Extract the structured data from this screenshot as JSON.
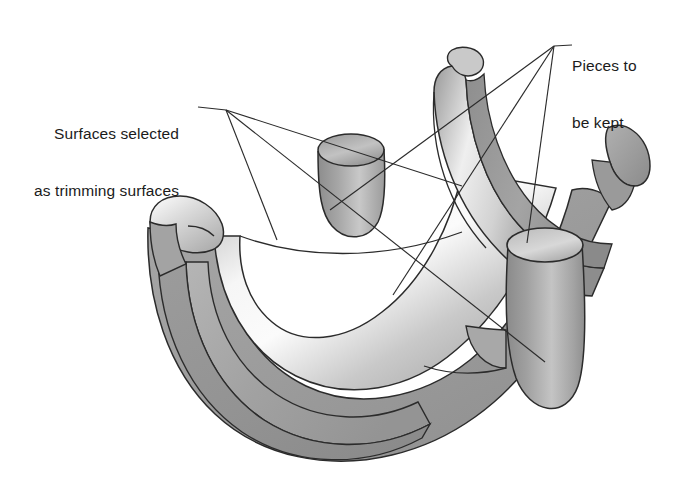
{
  "figure": {
    "background_color": "#ffffff",
    "width": 680,
    "height": 500
  },
  "callouts": {
    "left": {
      "name": "surfaces-selected-callout",
      "line1": "Surfaces selected",
      "line2": "as trimming surfaces",
      "leader_vertex": [
        226,
        110
      ],
      "leader_endpoints": [
        [
          277,
          240
        ],
        [
          462,
          186
        ],
        [
          545,
          362
        ]
      ]
    },
    "right": {
      "name": "pieces-to-be-kept-callout",
      "line1": "Pieces to",
      "line2": "be kept",
      "leader_vertex": [
        554,
        46
      ],
      "leader_endpoints": [
        [
          330,
          210
        ],
        [
          393,
          295
        ],
        [
          527,
          243
        ]
      ]
    }
  },
  "style": {
    "outline_color": "#2b2b2b",
    "leader_color": "#2b2b2b",
    "text_color": "#1b1b1b",
    "shade_light": "#f2f2f2",
    "shade_mid": "#b9b9b9",
    "shade_dark": "#8e8e8e",
    "shade_darker": "#7a7a7a"
  },
  "geometry": {
    "description": "Half pipe trough with branch cylinders trimmed by surfaces",
    "parts": [
      {
        "name": "main-trough",
        "kind": "half-cylinder-shell"
      },
      {
        "name": "left-rim",
        "kind": "tube-end-cap"
      },
      {
        "name": "small-branch-cylinder",
        "kind": "cut-cylinder"
      },
      {
        "name": "curved-ridge",
        "kind": "swept-band"
      },
      {
        "name": "right-branch-cylinder",
        "kind": "cut-cylinder"
      },
      {
        "name": "right-hook-end",
        "kind": "trimmed-flange"
      }
    ]
  }
}
